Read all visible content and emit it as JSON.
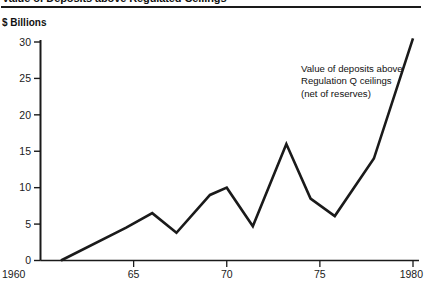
{
  "title": "Value of Deposits above Regulated Ceilings",
  "axis_caption": "$ Billions",
  "annotation": "Value of deposits above Regulation Q ceilings (net of reserves)",
  "colors": {
    "line": "#1a1a1a",
    "axis": "#1a1a1a",
    "background": "#ffffff",
    "text": "#111111"
  },
  "chart_data": {
    "type": "line",
    "title": "Value of Deposits above Regulated Ceilings",
    "subtitle": "",
    "xlabel": "",
    "ylabel": "$ Billions",
    "xlim": [
      1960,
      1980
    ],
    "ylim": [
      0,
      30
    ],
    "xticks": [
      1960,
      1965,
      1970,
      1975,
      1980
    ],
    "xtick_labels": [
      "1960",
      "65",
      "70",
      "75",
      "1980"
    ],
    "yticks": [
      0,
      5,
      10,
      15,
      20,
      25,
      30
    ],
    "ytick_labels": [
      "0",
      "5",
      "10",
      "15",
      "20",
      "25",
      "30"
    ],
    "grid": false,
    "legend": false,
    "annotations": [
      {
        "text": "Value of deposits above Regulation Q ceilings (net of reserves)",
        "x": 1973.2,
        "y": 26.5
      }
    ],
    "series": [
      {
        "name": "Value of deposits above Regulation Q ceilings (net of reserves)",
        "x": [
          1961.1,
          1964.6,
          1966.0,
          1967.3,
          1969.1,
          1970.0,
          1971.4,
          1973.2,
          1974.5,
          1975.8,
          1977.9,
          1980.0
        ],
        "values": [
          0.0,
          4.5,
          6.5,
          3.8,
          9.0,
          10.0,
          4.7,
          16.0,
          8.5,
          6.1,
          14.0,
          30.5
        ]
      }
    ]
  }
}
